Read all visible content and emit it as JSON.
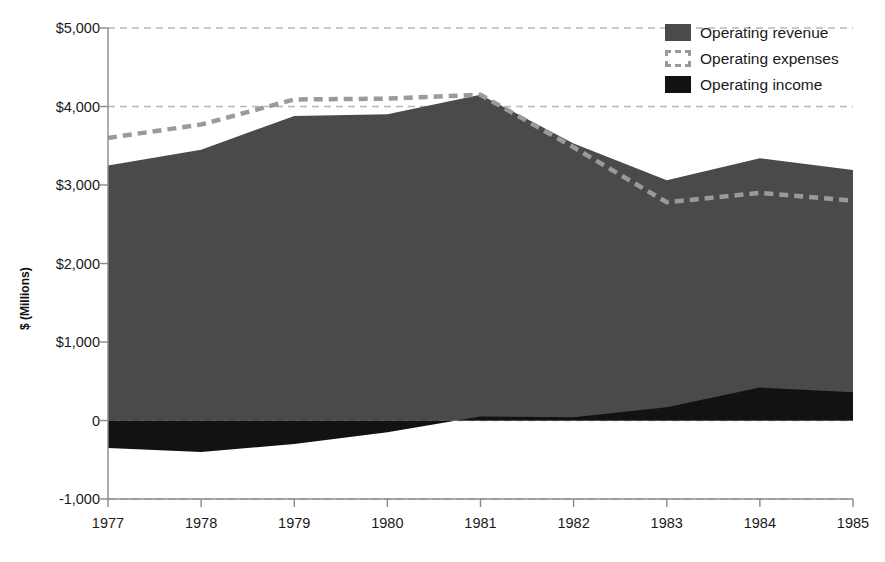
{
  "chart_data": {
    "type": "area",
    "title": "",
    "xlabel": "",
    "ylabel": "$ (Millions)",
    "categories": [
      "1977",
      "1978",
      "1979",
      "1980",
      "1981",
      "1982",
      "1983",
      "1984",
      "1985"
    ],
    "ylim": [
      -1000,
      5000
    ],
    "ytick_values": [
      5000,
      4000,
      3000,
      2000,
      1000,
      0,
      -1000
    ],
    "ytick_labels": [
      "$5,000",
      "$4,000",
      "$3,000",
      "$2,000",
      "$1,000",
      "0",
      "-1,000"
    ],
    "grid": true,
    "grid_style": "dashed-horizontal",
    "legend_position": "top-right",
    "series": [
      {
        "name": "Operating revenue",
        "render": "area",
        "color": "#4a4a4a",
        "values": [
          3250,
          3450,
          3880,
          3900,
          4150,
          3530,
          3060,
          3340,
          3190
        ]
      },
      {
        "name": "Operating expenses",
        "render": "dashed-line",
        "color": "#9a9a9a",
        "values": [
          3600,
          3770,
          4090,
          4100,
          4150,
          3480,
          2780,
          2900,
          2800
        ]
      },
      {
        "name": "Operating income",
        "render": "area",
        "color": "#121212",
        "values": [
          -350,
          -400,
          -300,
          -150,
          50,
          40,
          170,
          420,
          360
        ]
      }
    ]
  },
  "legend": {
    "items": [
      {
        "label": "Operating revenue",
        "swatch": "filled-dark-gray-square"
      },
      {
        "label": "Operating expenses",
        "swatch": "dashed-outline-square"
      },
      {
        "label": "Operating income",
        "swatch": "filled-black-square"
      }
    ]
  },
  "colors": {
    "revenue_fill": "#4a4a4a",
    "income_fill": "#121212",
    "expenses_line": "#9a9a9a",
    "gridline": "#b9b9b9",
    "axis": "#8a8a8a",
    "text": "#1a1a1a",
    "background": "#ffffff"
  }
}
